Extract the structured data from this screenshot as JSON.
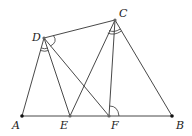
{
  "diagram": {
    "type": "geometry",
    "points": [
      {
        "name": "A",
        "x": 22,
        "y": 116,
        "label_x": 12,
        "label_y": 129,
        "filled": true
      },
      {
        "name": "E",
        "x": 70,
        "y": 116,
        "label_x": 61,
        "label_y": 129,
        "filled": false
      },
      {
        "name": "F",
        "x": 109,
        "y": 116,
        "label_x": 111,
        "label_y": 129,
        "filled": false
      },
      {
        "name": "B",
        "x": 172,
        "y": 116,
        "label_x": 176,
        "label_y": 129,
        "filled": true
      },
      {
        "name": "D",
        "x": 44,
        "y": 38,
        "label_x": 32,
        "label_y": 40,
        "filled": false
      },
      {
        "name": "C",
        "x": 115,
        "y": 20,
        "label_x": 119,
        "label_y": 17,
        "filled": false
      }
    ],
    "segments": [
      [
        "A",
        "B"
      ],
      [
        "D",
        "C"
      ],
      [
        "D",
        "A"
      ],
      [
        "D",
        "E"
      ],
      [
        "D",
        "F"
      ],
      [
        "C",
        "E"
      ],
      [
        "C",
        "F"
      ],
      [
        "C",
        "B"
      ]
    ],
    "angle_marks": [
      {
        "vertex": "D",
        "between": [
          "A",
          "E"
        ],
        "arcs": 2
      },
      {
        "vertex": "C",
        "between": [
          "F",
          "B"
        ],
        "arcs": 2
      },
      {
        "vertex": "D",
        "between": [
          "C",
          "F"
        ],
        "arcs": 1
      },
      {
        "vertex": "F",
        "between": [
          "C",
          "B"
        ],
        "arcs": 1
      }
    ],
    "labels": {
      "A": "A",
      "B": "B",
      "C": "C",
      "D": "D",
      "E": "E",
      "F": "F"
    }
  }
}
